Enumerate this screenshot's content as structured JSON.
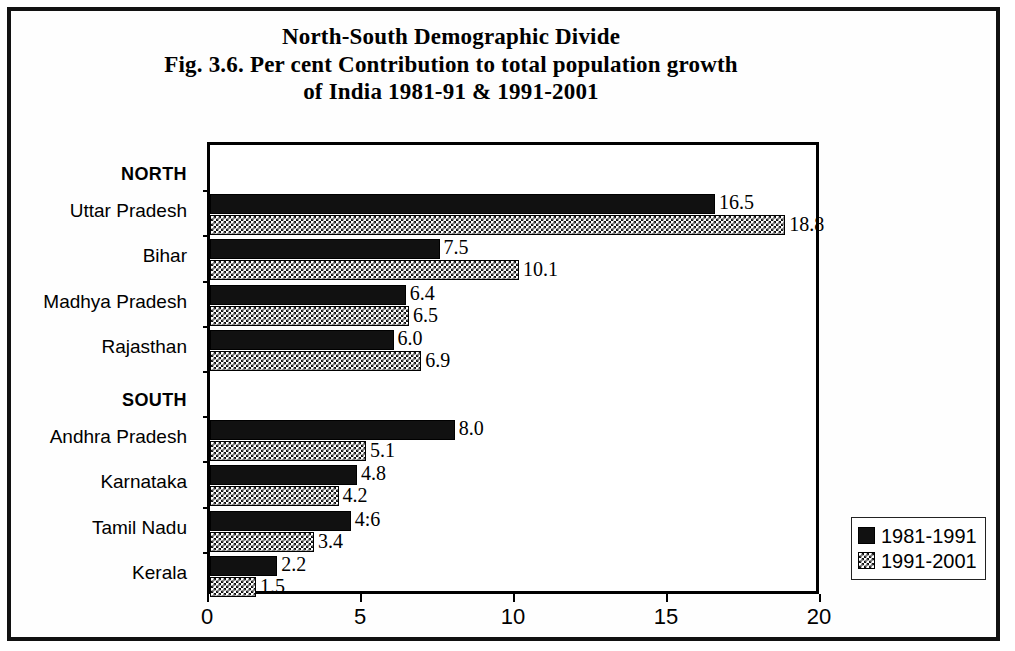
{
  "figure": {
    "title_line1": "North-South Demographic Divide",
    "title_line2": "Fig. 3.6. Per cent Contribution to total  population growth",
    "title_line3": "of India 1981-91 & 1991-2001",
    "frame_color": "#111111"
  },
  "chart_data": {
    "type": "bar",
    "orientation": "horizontal",
    "xlabel": "",
    "ylabel": "",
    "xlim": [
      0,
      20
    ],
    "xticks": [
      0,
      5,
      10,
      15,
      20
    ],
    "xtick_labels": [
      "0",
      "5",
      "10",
      "15",
      "20"
    ],
    "grid": false,
    "legend_position": "bottom-right-outside",
    "group_headers": [
      "NORTH",
      "SOUTH"
    ],
    "categories": [
      "NORTH",
      "Uttar Pradesh",
      "Bihar",
      "Madhya Pradesh",
      "Rajasthan",
      "SOUTH",
      "Andhra Pradesh",
      "Karnataka",
      "Tamil Nadu",
      "Kerala"
    ],
    "series": [
      {
        "name": "1981-1991",
        "fill": "solid-black",
        "color": "#111111",
        "values": [
          null,
          16.5,
          7.5,
          6.4,
          6.0,
          null,
          8.0,
          4.8,
          4.6,
          2.2
        ],
        "labels": [
          "",
          "16.5",
          "7.5",
          "6.4",
          "6.0",
          "",
          "8.0",
          "4.8",
          "4:6",
          "2.2"
        ]
      },
      {
        "name": "1991-2001",
        "fill": "checkerboard",
        "color": "#111111",
        "values": [
          null,
          18.8,
          10.1,
          6.5,
          6.9,
          null,
          5.1,
          4.2,
          3.4,
          1.5
        ],
        "labels": [
          "",
          "18.8",
          "10.1",
          "6.5",
          "6.9",
          "",
          "5.1",
          "4.2",
          "3.4",
          "1.5"
        ]
      }
    ]
  },
  "legend": {
    "items": [
      {
        "label": "1981-1991",
        "swatch": "solid-black-swatch"
      },
      {
        "label": "1991-2001",
        "swatch": "checkerboard-swatch"
      }
    ]
  }
}
